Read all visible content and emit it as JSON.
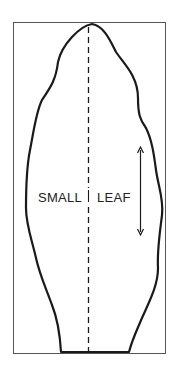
{
  "diagram": {
    "labels": {
      "left": "SMALL",
      "right": "LEAF"
    },
    "colors": {
      "stroke": "#1a1a1a",
      "frame": "#555555",
      "background": "#ffffff"
    }
  }
}
